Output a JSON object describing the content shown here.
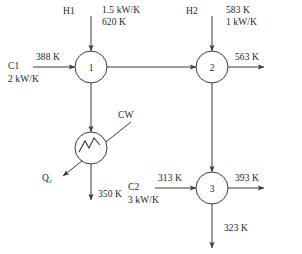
{
  "diagram": {
    "type": "heat-exchanger-network-flowsheet",
    "units": [
      {
        "id": "1",
        "label": "1",
        "cx": 91,
        "cy": 67,
        "r": 16
      },
      {
        "id": "2",
        "label": "2",
        "cx": 212,
        "cy": 67,
        "r": 16
      },
      {
        "id": "3",
        "label": "3",
        "cx": 212,
        "cy": 188,
        "r": 16
      }
    ],
    "cooler": {
      "id": "cooler",
      "label": "CW",
      "cx": 91,
      "cy": 148,
      "r": 16
    },
    "streams": {
      "h1": {
        "name": "H1",
        "heat_capacity_flow": "1.5 kW/K",
        "supply_temperature": "620 K",
        "target_temperature": "350 K"
      },
      "h2": {
        "name": "H2",
        "supply_temperature": "583 K",
        "heat_capacity_flow": "1 kW/K",
        "target_temperature": "323 K"
      },
      "c1": {
        "name": "C1",
        "supply_temperature": "388 K",
        "heat_capacity_flow": "2 kW/K",
        "target_temperature": "563 K"
      },
      "c2": {
        "name": "C2",
        "supply_temperature": "313 K",
        "heat_capacity_flow": "3 kW/K",
        "target_temperature": "393 K"
      }
    },
    "utility": {
      "cold_utility_label": "CW",
      "duty_symbol": "Q",
      "duty_subscript": "c"
    },
    "colors": {
      "line": "#3a3a3a",
      "text": "#262626",
      "background": "#ffffff"
    }
  }
}
